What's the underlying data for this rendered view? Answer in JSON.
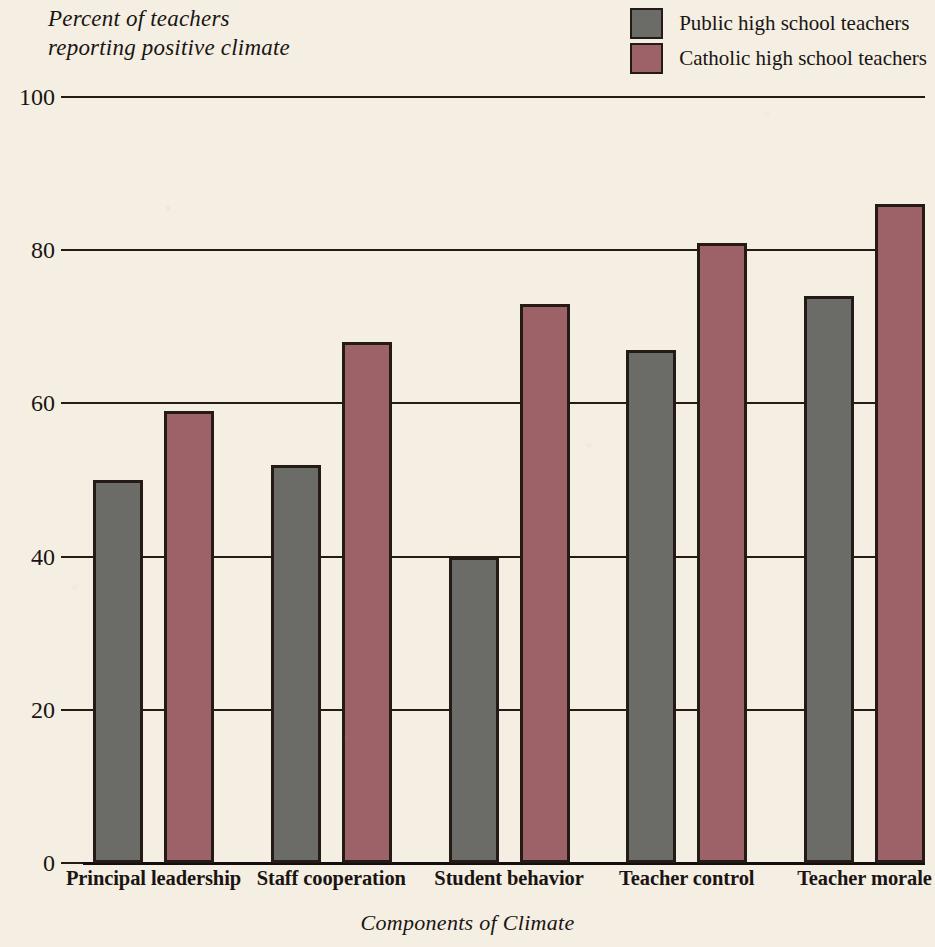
{
  "chart_data": {
    "type": "bar",
    "title": "",
    "ylabel": "Percent of teachers\nreporting positive climate",
    "xlabel": "Components of Climate",
    "categories": [
      "Principal leadership",
      "Staff cooperation",
      "Student behavior",
      "Teacher control",
      "Teacher morale"
    ],
    "series": [
      {
        "name": "Public high school teachers",
        "color": "#6b6b67",
        "values": [
          50,
          52,
          40,
          67,
          74
        ]
      },
      {
        "name": "Catholic high school teachers",
        "color": "#9d6268",
        "values": [
          59,
          68,
          73,
          81,
          86
        ]
      }
    ],
    "ylim": [
      0,
      100
    ],
    "yticks": [
      0,
      20,
      40,
      60,
      80,
      100
    ],
    "ytick_labels": [
      "0",
      "20",
      "40",
      "60",
      "80",
      "100"
    ],
    "grid": true,
    "legend_position": "top-right",
    "bar_outline_color": "#241a16",
    "background_color": "#f4eee3"
  }
}
